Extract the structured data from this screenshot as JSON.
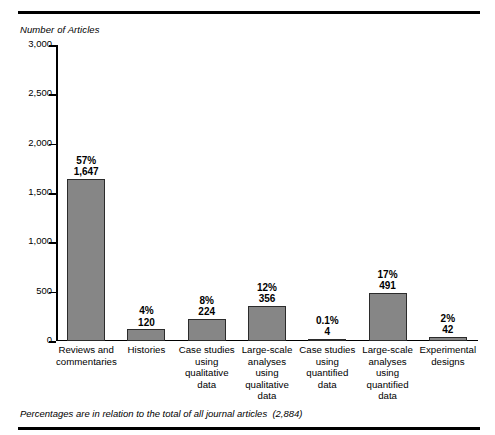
{
  "figure": {
    "y_axis_title": "Number of Articles",
    "footnote": "Percentages are in relation to the total of all journal articles  (2,884)",
    "bar_color": "#868686",
    "bar_outline_color": "#2b2b2b",
    "rule_color": "#000000"
  },
  "chart_data": {
    "type": "bar",
    "title": "",
    "subtitle": "",
    "xlabel": "",
    "ylabel": "Number of Articles",
    "ylim": [
      0,
      3000
    ],
    "ytick_labels": [
      "3,000",
      "2,500",
      "2,000",
      "1,500",
      "1,000",
      "500",
      "0"
    ],
    "ytick_values": [
      3000,
      2500,
      2000,
      1500,
      1000,
      500,
      0
    ],
    "grid": false,
    "legend": "none",
    "categories": [
      "Reviews and commentaries",
      "Histories",
      "Case studies using qualitative data",
      "Large-scale analyses using qualitative data",
      "Case studies using quantified data",
      "Large-scale analyses using quantified data",
      "Experimental designs"
    ],
    "category_lines": [
      [
        "Reviews and",
        "commentaries"
      ],
      [
        "Histories"
      ],
      [
        "Case studies",
        "using",
        "qualitative",
        "data"
      ],
      [
        "Large-scale",
        "analyses",
        "using",
        "qualitative",
        "data"
      ],
      [
        "Case studies",
        "using",
        "quantified",
        "data"
      ],
      [
        "Large-scale",
        "analyses",
        "using",
        "quantified",
        "data"
      ],
      [
        "Experimental",
        "designs"
      ]
    ],
    "values": [
      1647,
      120,
      224,
      356,
      4,
      491,
      42
    ],
    "value_labels": [
      "1,647",
      "120",
      "224",
      "356",
      "4",
      "491",
      "42"
    ],
    "percent_labels": [
      "57%",
      "4%",
      "8%",
      "12%",
      "0.1%",
      "17%",
      "2%"
    ],
    "total": 2884,
    "total_label": "(2,884)"
  }
}
